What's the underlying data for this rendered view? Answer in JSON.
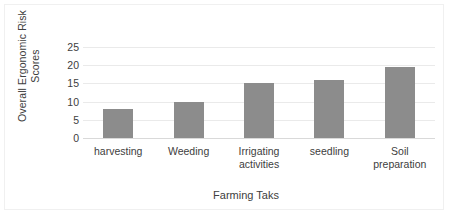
{
  "chart_data": {
    "type": "bar",
    "title": "",
    "xlabel": "Farming Taks",
    "ylabel": "Overall Ergonomic Risk Scores",
    "ylabel_lines": [
      "Overall Ergonomic Risk",
      "Scores"
    ],
    "categories": [
      "harvesting",
      "Weeding",
      "Irrigating activities",
      "seedling",
      "Soil preparation"
    ],
    "values": [
      8,
      10,
      15,
      16,
      19.5
    ],
    "ylim": [
      0,
      25
    ],
    "ytick_labels": [
      "0",
      "5",
      "10",
      "15",
      "20",
      "25"
    ],
    "ytick_values": [
      0,
      5,
      10,
      15,
      20,
      25
    ],
    "grid": true,
    "legend": "none",
    "series_color": "#8c8c8c",
    "gridline_color": "#eaeaea",
    "axis_color": "#d9d9d9",
    "text_color": "#404040",
    "frame_color": "#f0f0f0",
    "background": "#ffffff"
  }
}
